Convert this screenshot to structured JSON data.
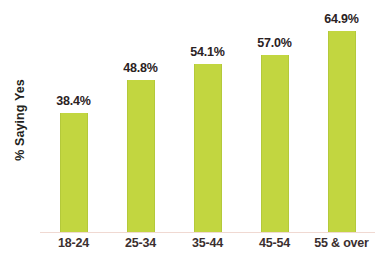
{
  "chart_data": {
    "type": "bar",
    "title": "",
    "subtitle": "",
    "xlabel": "",
    "ylabel": "% Saying Yes",
    "categories": [
      "18-24",
      "25-34",
      "35-44",
      "45-54",
      "55 & over"
    ],
    "values": [
      38.4,
      48.8,
      54.1,
      57.0,
      64.9
    ],
    "value_labels": [
      "38.4%",
      "48.8%",
      "54.1%",
      "57.0%",
      "64.9%"
    ],
    "series": [
      {
        "name": "% Saying Yes",
        "values": [
          38.4,
          48.8,
          54.1,
          57.0,
          64.9
        ]
      }
    ],
    "ylim": [
      0,
      70
    ],
    "grid": false,
    "legend": false,
    "legend_position": "none",
    "bar_color": "#c2d640",
    "baseline_color": "#f0d9d2",
    "label_color": "#2b2223",
    "background": "#ffffff"
  }
}
